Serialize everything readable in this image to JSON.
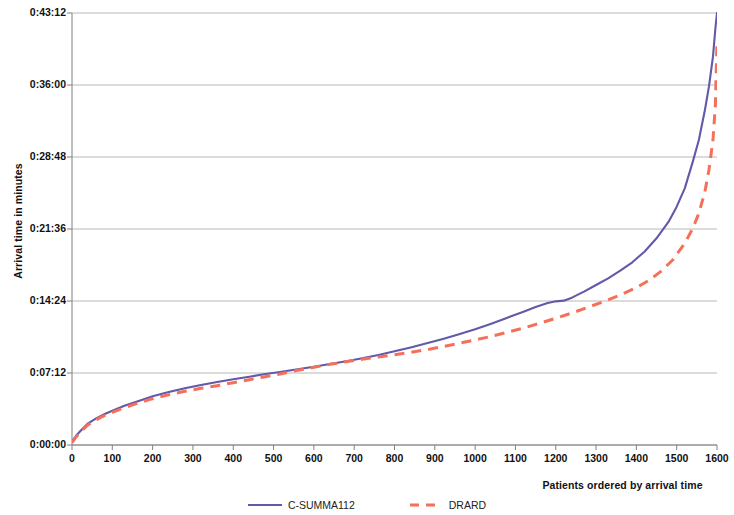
{
  "chart_data": {
    "type": "line",
    "title": "",
    "xlabel": "Patients ordered by arrival time",
    "ylabel": "Arrival time in minutes",
    "xlim": [
      0,
      1600
    ],
    "ylim": [
      0,
      2592
    ],
    "y_unit": "seconds (displayed as H:MM:SS)",
    "grid": true,
    "legend_position": "bottom-center",
    "x_ticks": [
      0,
      100,
      200,
      300,
      400,
      500,
      600,
      700,
      800,
      900,
      1000,
      1100,
      1200,
      1300,
      1400,
      1500,
      1600
    ],
    "x_tick_labels": [
      "0",
      "100",
      "200",
      "300",
      "400",
      "500",
      "600",
      "700",
      "800",
      "900",
      "1000",
      "1100",
      "1200",
      "1300",
      "1400",
      "1500",
      "1600"
    ],
    "y_ticks": [
      0,
      432,
      864,
      1296,
      1728,
      2160,
      2592
    ],
    "y_tick_labels": [
      "0:00:00",
      "0:07:12",
      "0:14:24",
      "0:21:36",
      "0:28:48",
      "0:36:00",
      "0:43:12"
    ],
    "series": [
      {
        "name": "C-SUMMA112",
        "color": "#6259A8",
        "style": "solid",
        "x": [
          0,
          10,
          25,
          40,
          60,
          80,
          100,
          130,
          160,
          200,
          240,
          280,
          320,
          360,
          400,
          440,
          480,
          520,
          560,
          600,
          640,
          680,
          720,
          760,
          800,
          840,
          880,
          920,
          960,
          1000,
          1040,
          1080,
          1120,
          1150,
          1180,
          1200,
          1220,
          1240,
          1270,
          1300,
          1330,
          1360,
          1390,
          1420,
          1450,
          1480,
          1500,
          1520,
          1540,
          1555,
          1570,
          1580,
          1590,
          1596,
          1600
        ],
        "y": [
          20,
          55,
          95,
          130,
          160,
          185,
          205,
          235,
          260,
          292,
          318,
          340,
          360,
          378,
          394,
          410,
          426,
          440,
          455,
          470,
          486,
          502,
          520,
          540,
          562,
          585,
          610,
          636,
          664,
          694,
          728,
          764,
          800,
          828,
          852,
          862,
          866,
          884,
          920,
          960,
          1000,
          1046,
          1096,
          1160,
          1240,
          1340,
          1430,
          1540,
          1700,
          1830,
          2010,
          2150,
          2330,
          2500,
          2592
        ]
      },
      {
        "name": "DRARD",
        "color": "#F4705A",
        "style": "dashed",
        "x": [
          0,
          10,
          25,
          40,
          60,
          80,
          100,
          130,
          160,
          200,
          240,
          280,
          320,
          360,
          400,
          440,
          480,
          520,
          560,
          600,
          640,
          680,
          720,
          760,
          800,
          840,
          880,
          920,
          960,
          1000,
          1040,
          1080,
          1120,
          1160,
          1200,
          1240,
          1280,
          1320,
          1360,
          1400,
          1430,
          1460,
          1490,
          1520,
          1540,
          1555,
          1570,
          1580,
          1590,
          1596,
          1600
        ],
        "y": [
          14,
          48,
          88,
          122,
          152,
          176,
          196,
          224,
          248,
          278,
          302,
          322,
          340,
          356,
          374,
          392,
          410,
          428,
          448,
          466,
          484,
          500,
          514,
          528,
          542,
          556,
          572,
          590,
          610,
          630,
          652,
          676,
          702,
          730,
          760,
          792,
          826,
          862,
          900,
          944,
          986,
          1040,
          1110,
          1210,
          1300,
          1390,
          1520,
          1650,
          1830,
          2040,
          2420
        ]
      }
    ]
  },
  "axis": {
    "y_title": "Arrival time in minutes",
    "x_title": "Patients ordered by arrival time"
  },
  "legend": {
    "items": [
      {
        "label": "C-SUMMA112",
        "color": "#6259A8",
        "style": "solid"
      },
      {
        "label": "DRARD",
        "color": "#F4705A",
        "style": "dashed"
      }
    ]
  },
  "colors": {
    "series_1": "#6259A8",
    "series_2": "#F4705A",
    "gridline": "#b0b0b0",
    "axis": "#808080",
    "background": "#ffffff",
    "text": "#111111"
  }
}
